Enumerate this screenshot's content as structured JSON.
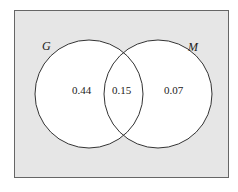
{
  "diagram": {
    "type": "venn",
    "sets": [
      {
        "name": "G",
        "label": "G"
      },
      {
        "name": "M",
        "label": "M"
      }
    ],
    "regions": {
      "g_only": "0.44",
      "g_and_m": "0.15",
      "m_only": "0.07"
    }
  },
  "colors": {
    "universe_fill": "#e6e6e6",
    "circle_fill": "#ffffff",
    "stroke": "#333333"
  }
}
